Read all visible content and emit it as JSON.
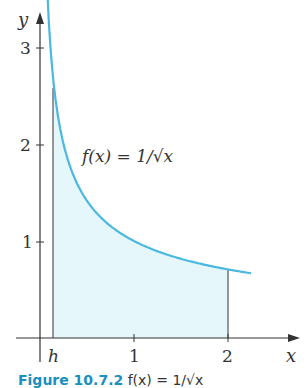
{
  "chart_data": {
    "type": "area",
    "title": "",
    "function_label": "f(x) = 1/√x",
    "xlabel": "x",
    "ylabel": "y",
    "x_ticks": [
      {
        "value": "h",
        "label": "h"
      },
      {
        "value": 1,
        "label": "1"
      },
      {
        "value": 2,
        "label": "2"
      }
    ],
    "y_ticks": [
      {
        "value": 1,
        "label": "1"
      },
      {
        "value": 2,
        "label": "2"
      },
      {
        "value": 3,
        "label": "3"
      }
    ],
    "xlim": [
      -0.15,
      2.5
    ],
    "ylim": [
      0,
      3.2
    ],
    "shaded_region": {
      "from": "h",
      "to": 2,
      "h_approx": 0.14
    },
    "series": [
      {
        "name": "f(x) = 1/√x",
        "x": [
          0.075,
          0.1,
          0.14,
          0.2,
          0.3,
          0.5,
          0.75,
          1,
          1.25,
          1.5,
          1.75,
          2,
          2.25
        ],
        "values": [
          3.65,
          3.16,
          2.67,
          2.24,
          1.83,
          1.41,
          1.15,
          1.0,
          0.89,
          0.82,
          0.76,
          0.71,
          0.67
        ]
      }
    ],
    "grid": false,
    "legend": "none"
  },
  "labels": {
    "y_axis": "y",
    "x_axis": "x",
    "tick_h": "h",
    "tick_x1": "1",
    "tick_x2": "2",
    "tick_y1": "1",
    "tick_y2": "2",
    "tick_y3": "3",
    "function": "f(x) = 1/√x"
  },
  "colors": {
    "curve": "#4bb8e0",
    "fill": "#e6f7fc",
    "axis": "#333333"
  },
  "caption": {
    "prefix": "Figure 10.7.2",
    "text": "f(x) = 1/√x"
  }
}
